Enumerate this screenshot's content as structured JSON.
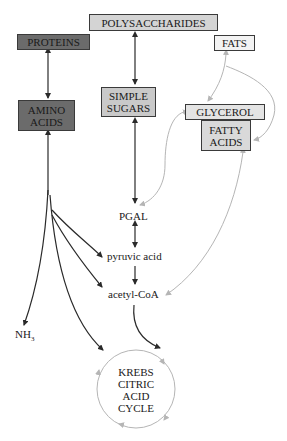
{
  "diagram": {
    "nodes": {
      "polysaccharides": "POLYSACCHARIDES",
      "proteins": "PROTEINS",
      "fats": "FATS",
      "amino_acids": [
        "AMINO",
        "ACIDS"
      ],
      "simple_sugars": [
        "SIMPLE",
        "SUGARS"
      ],
      "glycerol": "GLYCEROL",
      "fatty_acids": [
        "FATTY",
        "ACIDS"
      ],
      "pgal": "PGAL",
      "pyruvic_acid": "pyruvic acid",
      "acetyl_coa": "acetyl-CoA",
      "nh3": "NH",
      "nh3_sub": "3",
      "krebs": [
        "KREBS",
        "CITRIC",
        "ACID",
        "CYCLE"
      ]
    },
    "colors": {
      "dark_box": "#6b6b6b",
      "mid_box": "#c9c9c9",
      "light_box": "#ececec",
      "dark_arrow": "#2a2a2a",
      "light_arrow": "#b5b5b5"
    }
  }
}
